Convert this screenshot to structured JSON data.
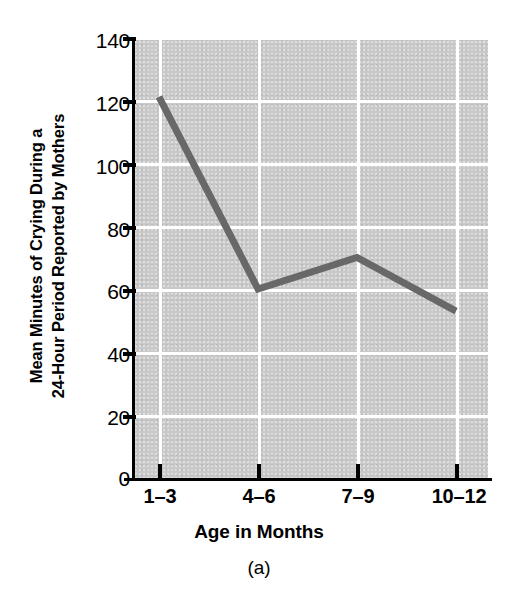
{
  "chart_data": {
    "type": "line",
    "title": "",
    "caption": "(a)",
    "xlabel": "Age in Months",
    "ylabel_lines": [
      "Mean Minutes of Crying During a",
      "24-Hour Period Reported by Mothers"
    ],
    "ylabel": "Mean Minutes of Crying During a 24-Hour Period Reported by Mothers",
    "categories": [
      "1–3",
      "4–6",
      "7–9",
      "10–12"
    ],
    "values": [
      121,
      60,
      70,
      53
    ],
    "series": [
      {
        "name": "Mean minutes of crying",
        "values": [
          121,
          60,
          70,
          53
        ]
      }
    ],
    "ylim": [
      0,
      140
    ],
    "yticks": [
      0,
      20,
      40,
      60,
      80,
      100,
      120,
      140
    ],
    "ytick_labels": [
      "0",
      "20",
      "40",
      "60",
      "80",
      "100",
      "120",
      "140"
    ],
    "grid": "white gridlines on gray plot background",
    "legend": "none",
    "colors": {
      "plot_background": "#c9c9c9",
      "gridline": "#ffffff",
      "line": "#686868",
      "axis": "#000000",
      "text": "#000000",
      "page_background": "#ffffff"
    }
  }
}
